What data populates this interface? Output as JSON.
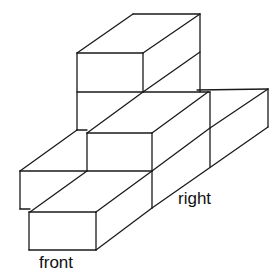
{
  "figure": {
    "type": "isometric block stack",
    "labels": {
      "front": "front",
      "right": "right"
    },
    "stroke_color": "#1a1a1a",
    "background": "#ffffff"
  }
}
